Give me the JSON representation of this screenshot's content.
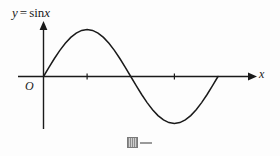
{
  "figure": {
    "background_color": "#fdfdfd",
    "ink_color": "#1a1a1a",
    "width": 280,
    "height": 156,
    "function_label": {
      "y_symbol": "y",
      "equals": "=",
      "function_name": "sin",
      "argument": "x",
      "full_text": "y = sin x"
    },
    "origin_label": "O",
    "x_axis_label": "x",
    "artifact": {
      "glyph_name": "missing-glyph-box",
      "trailing_dash": "—"
    }
  },
  "chart_data": {
    "type": "line",
    "xlabel": "x",
    "ylabel": "",
    "grid": false,
    "legend": null,
    "axis_style": "arrowed-cartesian",
    "xlim": [
      -0.5,
      7.3
    ],
    "ylim": [
      -1.45,
      1.45
    ],
    "x_ticks": [
      1.5707963,
      4.712389
    ],
    "x_tick_labels": [
      "",
      ""
    ],
    "x_tick_style": "unlabeled-small-ticks",
    "y_ticks": [],
    "y_tick_labels": [],
    "series": [
      {
        "name": "y = sin x",
        "color": "#1a1a1a",
        "x": [
          0.0,
          0.1963,
          0.3927,
          0.589,
          0.7854,
          0.9817,
          1.1781,
          1.3744,
          1.5708,
          1.7671,
          1.9635,
          2.1598,
          2.3562,
          2.5525,
          2.7489,
          2.9452,
          3.1416,
          3.3379,
          3.5343,
          3.7306,
          3.927,
          4.1233,
          4.3197,
          4.516,
          4.7124,
          4.9087,
          5.1051,
          5.3014,
          5.4978,
          5.6941,
          5.8905,
          6.0868,
          6.2832
        ],
        "y": [
          0.0,
          0.1951,
          0.3827,
          0.5556,
          0.7071,
          0.8315,
          0.9239,
          0.9808,
          1.0,
          0.9808,
          0.9239,
          0.8315,
          0.7071,
          0.5556,
          0.3827,
          0.1951,
          0.0,
          -0.1951,
          -0.3827,
          -0.5556,
          -0.7071,
          -0.8315,
          -0.9239,
          -0.9808,
          -1.0,
          -0.9808,
          -0.9239,
          -0.8315,
          -0.7071,
          -0.5556,
          -0.3827,
          -0.1951,
          0.0
        ]
      }
    ],
    "annotations": [
      {
        "text": "y = sin x",
        "x": 0.1,
        "y": 1.35
      },
      {
        "text": "O",
        "x": -0.25,
        "y": -0.22
      },
      {
        "text": "x",
        "x": 7.2,
        "y": 0.18
      }
    ],
    "key_points": {
      "origin": [
        0,
        0
      ],
      "maximum": [
        1.5707963,
        1
      ],
      "zero_crossing": [
        3.1415927,
        0
      ],
      "minimum": [
        4.712389,
        -1
      ],
      "end": [
        6.2831853,
        0
      ]
    }
  }
}
